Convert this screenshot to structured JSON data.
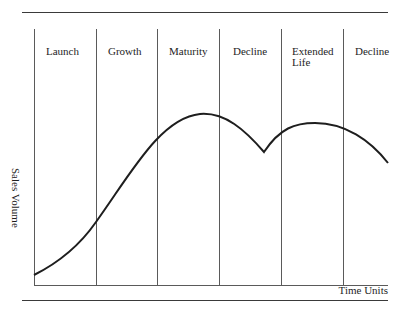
{
  "diagram": {
    "y_axis_label": "Sales Volume",
    "x_axis_label": "Time Units",
    "phases": [
      {
        "label": "Launch"
      },
      {
        "label": "Growth"
      },
      {
        "label": "Maturity"
      },
      {
        "label": "Decline"
      },
      {
        "label": "Extended\nLife"
      },
      {
        "label": "Decline"
      }
    ],
    "curve_color": "#1e1e1e",
    "line_color": "#5a5a5a"
  }
}
